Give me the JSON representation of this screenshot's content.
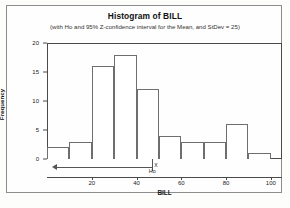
{
  "chart_data": {
    "type": "bar",
    "title": "Histogram of BILL",
    "subtitle": "(with Ho and 95% Z-confidence interval for the Mean, and StDev = 25)",
    "xlabel": "BILL",
    "ylabel": "Frequency",
    "xlim": [
      0,
      105
    ],
    "ylim": [
      0,
      20
    ],
    "grid": false,
    "legend": null,
    "bin_width": 10,
    "bin_edges": [
      0,
      10,
      20,
      30,
      40,
      50,
      60,
      70,
      80,
      90,
      100
    ],
    "categories": [
      "0-10",
      "10-20",
      "20-30",
      "30-40",
      "40-50",
      "50-60",
      "60-70",
      "70-80",
      "80-90",
      "90-100"
    ],
    "values": [
      2,
      3,
      16,
      18,
      12,
      4,
      3,
      3,
      6,
      1
    ],
    "bar_centers": [
      5,
      15,
      25,
      35,
      45,
      55,
      65,
      75,
      85,
      95
    ],
    "xticks": [
      20,
      40,
      60,
      80,
      100
    ],
    "xtick_labels": [
      "20",
      "40",
      "60",
      "80",
      "100"
    ],
    "yticks": [
      0,
      5,
      10,
      15,
      20
    ],
    "ytick_labels": [
      "0",
      "5",
      "10",
      "15",
      "20"
    ],
    "annotations": {
      "ho_label": "Ho",
      "ho_value": 47,
      "xbar_label": "X",
      "xbar_value": 47,
      "ci_left_value": 4,
      "ci_right_value": 47,
      "ci_arrow_direction": "left"
    }
  }
}
